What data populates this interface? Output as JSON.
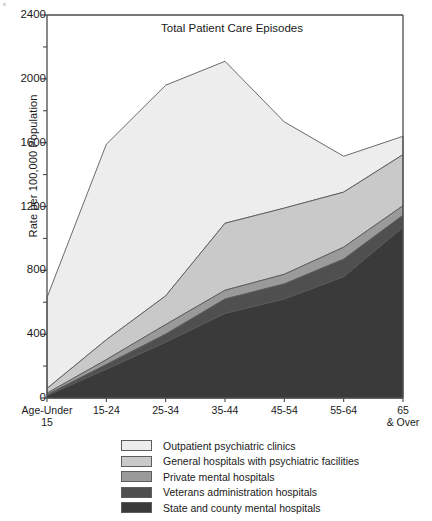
{
  "chart_data": {
    "type": "area",
    "title": "Total Patient Care Episodes",
    "xlabel": "",
    "ylabel": "Rate per 100,000 Population",
    "ylim": [
      0,
      2400
    ],
    "yticks": [
      0,
      400,
      800,
      1200,
      1600,
      2000,
      2400
    ],
    "ytick_labels": [
      "0",
      "400",
      "800",
      "1200",
      "1600",
      "2000",
      "2400"
    ],
    "minor_yticks": [
      200,
      600,
      1000,
      1400,
      1800,
      2200
    ],
    "grid": false,
    "stacked": true,
    "legend_position": "below",
    "categories": [
      "Age-Under 15",
      "15-24",
      "25-34",
      "35-44",
      "45-54",
      "55-64",
      "65 & Over"
    ],
    "category_display": [
      "Age-Under\n15",
      "15-24",
      "25-34",
      "35-44",
      "45-54",
      "55-64",
      "65\n& Over"
    ],
    "series": [
      {
        "name": "State and county mental hospitals",
        "color": "#3a3a3a",
        "values": [
          15,
          180,
          350,
          530,
          620,
          760,
          1070
        ]
      },
      {
        "name": "Veterans administration hospitals",
        "color": "#4f4f4f",
        "values": [
          5,
          30,
          50,
          90,
          95,
          110,
          75
        ]
      },
      {
        "name": "Private mental hospitals",
        "color": "#9a9a9a",
        "values": [
          10,
          30,
          60,
          55,
          60,
          75,
          60
        ]
      },
      {
        "name": "General hospitals with psychiatric facilities",
        "color": "#c9c9c9",
        "values": [
          30,
          125,
          180,
          420,
          415,
          345,
          320
        ]
      },
      {
        "name": "Outpatient psychiatric clinics",
        "color": "#ededed",
        "values": [
          570,
          1225,
          1320,
          1015,
          540,
          225,
          115
        ]
      }
    ],
    "cumulative_tops": {
      "State and county mental hospitals": [
        15,
        180,
        350,
        530,
        620,
        760,
        1070
      ],
      "Veterans administration hospitals": [
        20,
        210,
        400,
        620,
        715,
        870,
        1145
      ],
      "Private mental hospitals": [
        30,
        240,
        460,
        675,
        775,
        945,
        1205
      ],
      "General hospitals with psychiatric facilities": [
        60,
        365,
        640,
        1095,
        1190,
        1290,
        1525
      ],
      "Outpatient psychiatric clinics": [
        630,
        1590,
        1960,
        2110,
        1730,
        1515,
        1640
      ]
    }
  },
  "legend": {
    "items": [
      {
        "label": "Outpatient psychiatric clinics",
        "color": "#ededed"
      },
      {
        "label": "General hospitals with psychiatric facilities",
        "color": "#c9c9c9"
      },
      {
        "label": "Private mental hospitals",
        "color": "#9a9a9a"
      },
      {
        "label": "Veterans administration hospitals",
        "color": "#4f4f4f"
      },
      {
        "label": "State and county mental hospitals",
        "color": "#3a3a3a"
      }
    ]
  },
  "axes": {
    "outline_color": "#4a4a4a"
  }
}
